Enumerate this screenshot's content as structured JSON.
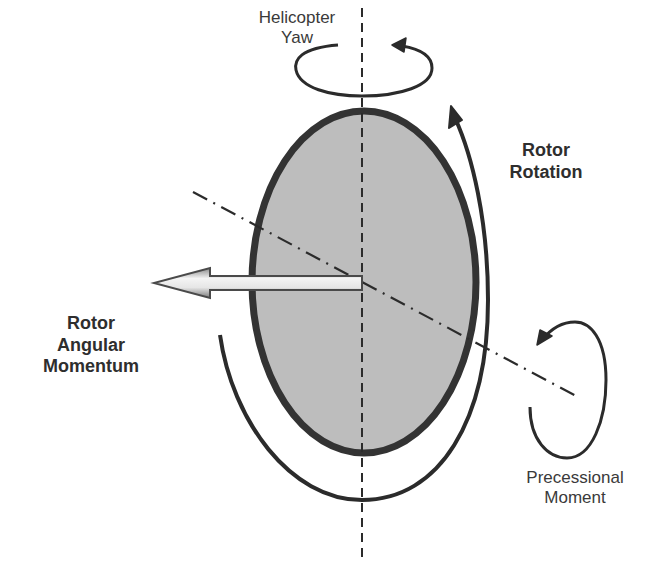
{
  "diagram": {
    "labels": {
      "helicopter_yaw": [
        "Helicopter",
        "Yaw"
      ],
      "rotor_rotation": [
        "Rotor",
        "Rotation"
      ],
      "rotor_angular_momentum": [
        "Rotor",
        "Angular",
        "Momentum"
      ],
      "precessional_moment": [
        "Precessional",
        "Moment"
      ]
    },
    "colors": {
      "background": "#ffffff",
      "rotor_disc_fill": "#bdbdbd",
      "rotor_disc_stroke": "#333333",
      "lines": "#2b2b2b",
      "arrow_fill_light": "#f2f2f2",
      "arrow_fill_dark": "#9a9a9a",
      "text": "#333333"
    },
    "elements": [
      "rotor-disc (gray ellipse)",
      "vertical dashed yaw axis",
      "dash-dot tilted axis",
      "angular momentum arrow (pointing left)",
      "rotor rotation arc arrow (counter-clockwise, arrowhead at top right)",
      "helicopter yaw circular arrow (top)",
      "precessional moment circular arrow (right)"
    ]
  }
}
